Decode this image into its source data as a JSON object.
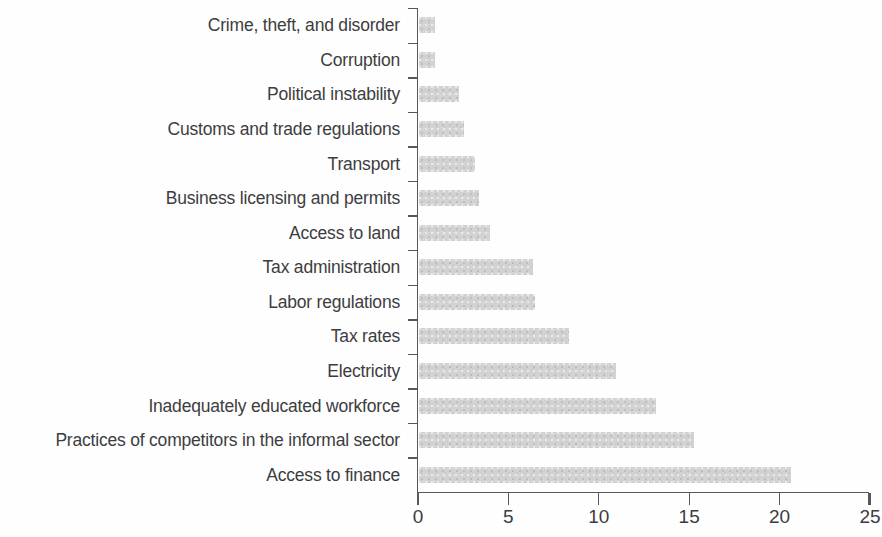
{
  "chart_data": {
    "type": "bar",
    "orientation": "horizontal",
    "title": "",
    "subtitle": "",
    "xlabel": "",
    "ylabel": "",
    "xlim": [
      0,
      25
    ],
    "xticks": [
      0,
      5,
      10,
      15,
      20,
      25
    ],
    "xtick_labels": [
      "0",
      "5",
      "10",
      "15",
      "20",
      "25"
    ],
    "grid": false,
    "legend": null,
    "bar_color": "#d2d2d2",
    "axis_color": "#58585a",
    "text_color": "#3d3d3f",
    "categories": [
      "Crime, theft, and disorder",
      "Corruption",
      "Political instability",
      "Customs and trade regulations",
      "Transport",
      "Business licensing and permits",
      "Access to land",
      "Tax administration",
      "Labor regulations",
      "Tax rates",
      "Electricity",
      "Inadequately educated workforce",
      "Practices of competitors in the informal sector",
      "Access to finance"
    ],
    "values": [
      0.9,
      0.9,
      2.2,
      2.5,
      3.1,
      3.3,
      3.9,
      6.3,
      6.4,
      8.3,
      10.9,
      13.1,
      15.2,
      20.6
    ]
  }
}
